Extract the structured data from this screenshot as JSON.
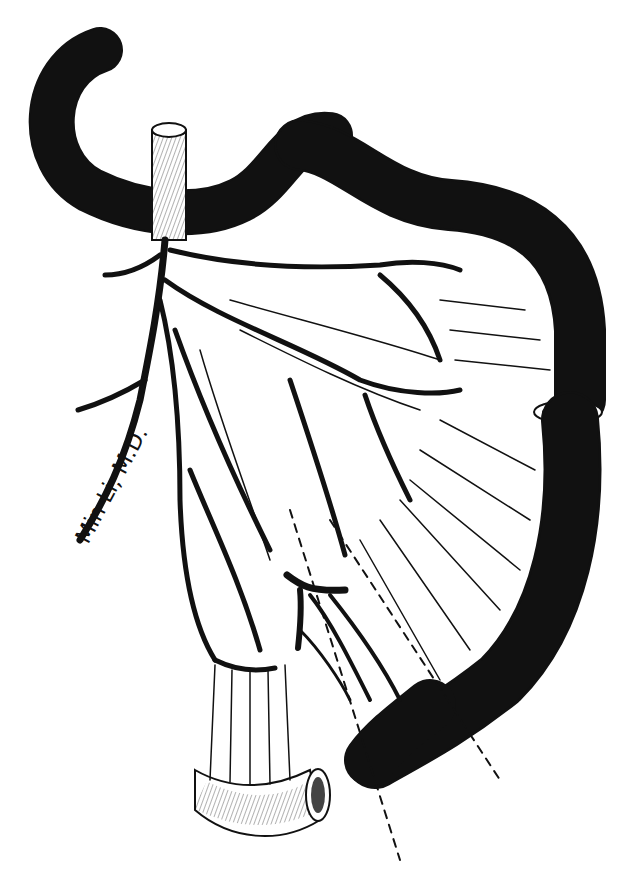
{
  "illustration": {
    "subject": "medical pen-and-ink illustration of bowel segment with mesenteric vascular arcades",
    "signature": "Min Li, M.D.",
    "colors": {
      "ink": "#111111",
      "paper": "#ffffff"
    }
  }
}
